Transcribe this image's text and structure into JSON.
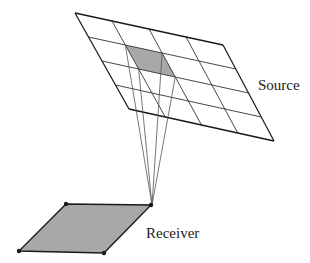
{
  "diagram": {
    "labels": {
      "source": "Source",
      "receiver": "Receiver"
    },
    "colors": {
      "stroke": "#1a1a1a",
      "grid": "#333333",
      "shade": "#a8a8a8",
      "ray": "#555555",
      "background": "#ffffff"
    },
    "source_grid": {
      "rows": 4,
      "columns": 4,
      "corners": {
        "top_left": [
          75,
          13
        ],
        "top_right": [
          223,
          45
        ],
        "bottom_right": [
          274,
          141
        ],
        "bottom_left": [
          129,
          109
        ]
      },
      "highlighted_cell": {
        "row": 1,
        "column": 1
      }
    },
    "receiver": {
      "corners": [
        [
          66,
          204
        ],
        [
          151,
          205
        ],
        [
          104,
          253
        ],
        [
          19,
          251
        ]
      ],
      "marked_vertices": true
    },
    "rays": {
      "count": 4,
      "converge_point": [
        152,
        205
      ]
    }
  }
}
